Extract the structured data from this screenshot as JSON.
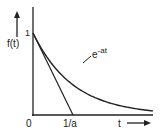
{
  "diagram": {
    "y_axis_label": "f(t)",
    "x_axis_label": "t",
    "origin_label": "0",
    "y_tick_label": "1",
    "x_tick_label": "1/a",
    "curve_label_base": "e",
    "curve_label_exponent": "-at",
    "curve_function": "exp(-a*t)",
    "tangent_description": "tangent at t=0 intersects t-axis at 1/a",
    "x_range_in_units_of_1_over_a": [
      0,
      3
    ],
    "y_range": [
      0,
      1
    ],
    "line_color": "#222222"
  }
}
